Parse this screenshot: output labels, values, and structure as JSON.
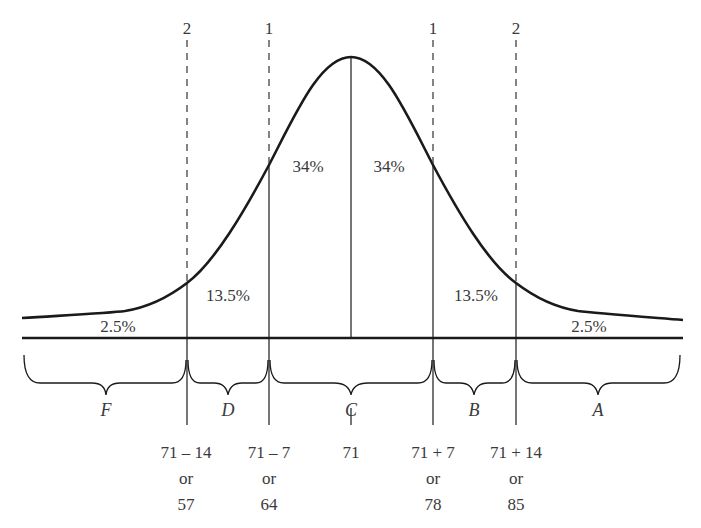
{
  "diagram": {
    "type": "normal-distribution-curve",
    "mean_label": "71",
    "sd_markers": [
      {
        "label": "2",
        "side": "left"
      },
      {
        "label": "1",
        "side": "left"
      },
      {
        "label": "1",
        "side": "right"
      },
      {
        "label": "2",
        "side": "right"
      }
    ],
    "area_percents": [
      {
        "region": "left-tail",
        "value": "2.5%"
      },
      {
        "region": "left-outer",
        "value": "13.5%"
      },
      {
        "region": "left-inner",
        "value": "34%"
      },
      {
        "region": "right-inner",
        "value": "34%"
      },
      {
        "region": "right-outer",
        "value": "13.5%"
      },
      {
        "region": "right-tail",
        "value": "2.5%"
      }
    ],
    "grade_bands": [
      {
        "letter": "F"
      },
      {
        "letter": "D"
      },
      {
        "letter": "C"
      },
      {
        "letter": "B"
      },
      {
        "letter": "A"
      }
    ],
    "cutoffs": [
      {
        "expr": "71 – 14",
        "or": "or",
        "value": "57"
      },
      {
        "expr": "71 – 7",
        "or": "or",
        "value": "64"
      },
      {
        "expr": "71",
        "or": "",
        "value": ""
      },
      {
        "expr": "71 + 7",
        "or": "or",
        "value": "78"
      },
      {
        "expr": "71 + 14",
        "or": "or",
        "value": "85"
      }
    ],
    "colors": {
      "stroke": "#1a1a1a",
      "text": "#3a3a3a",
      "background": "#ffffff"
    }
  }
}
